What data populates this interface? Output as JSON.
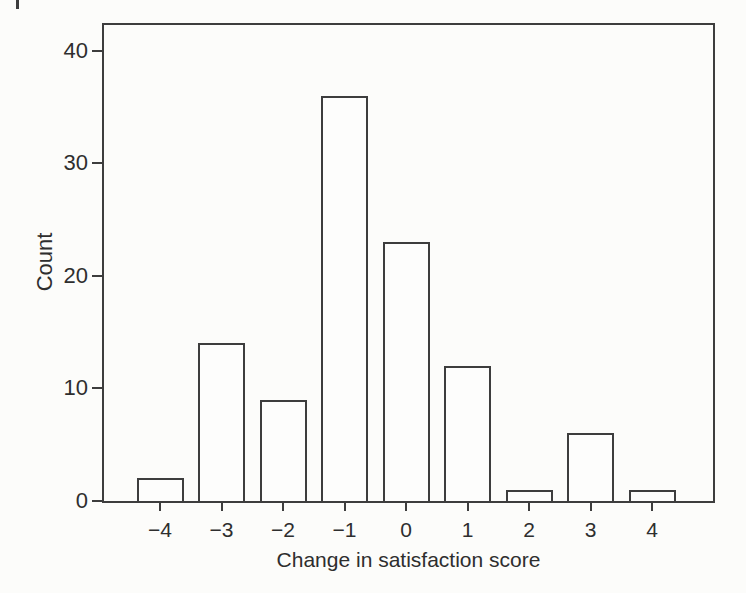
{
  "figure": {
    "background": "#fcfcfa",
    "line_color": "#3d3d3d",
    "text_color": "#2e2e2e",
    "artifact_note": "small page-edge mark at top-left of scan"
  },
  "chart_data": {
    "type": "bar",
    "title": "",
    "xlabel": "Change in satisfaction score",
    "ylabel": "Count",
    "categories": [
      "−4",
      "−3",
      "−2",
      "−1",
      "0",
      "1",
      "2",
      "3",
      "4"
    ],
    "values": [
      2,
      14,
      9,
      36,
      23,
      12,
      1,
      6,
      1
    ],
    "yticks": [
      0,
      10,
      20,
      30,
      40
    ],
    "ylim": [
      0,
      42.3
    ],
    "bar_fill": "#fdfdfc",
    "bar_outline": "#3d3d3d",
    "grid": false,
    "legend": null
  }
}
